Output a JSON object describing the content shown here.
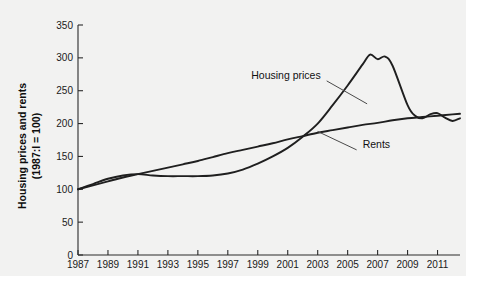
{
  "chart_data": {
    "type": "line",
    "title": "",
    "subtitle": "",
    "xlabel": "",
    "ylabel": "Housing prices and rents (1987:I = 100)",
    "ylabel_line1": "Housing prices and rents",
    "ylabel_line2": "(1987:I = 100)",
    "grid": false,
    "legend_position": "inline-annotations",
    "xlim": [
      1987,
      2012.5
    ],
    "ylim": [
      0,
      350
    ],
    "yticks": [
      0,
      50,
      100,
      150,
      200,
      250,
      300,
      350
    ],
    "ytick_labels": [
      "0",
      "50",
      "100",
      "150",
      "200",
      "250",
      "300",
      "350"
    ],
    "xticks": [
      1987,
      1989,
      1991,
      1993,
      1995,
      1997,
      1999,
      2001,
      2003,
      2005,
      2007,
      2009,
      2011
    ],
    "xtick_labels": [
      "1987",
      "1989",
      "1991",
      "1993",
      "1995",
      "1997",
      "1999",
      "2001",
      "2003",
      "2005",
      "2007",
      "2009",
      "2011"
    ],
    "series": [
      {
        "name": "Housing prices",
        "color": "#1f1f1f",
        "x": [
          1987,
          1988,
          1989,
          1990,
          1991,
          1992,
          1993,
          1994,
          1995,
          1996,
          1997,
          1998,
          1999,
          2000,
          2001,
          2002,
          2003,
          2004,
          2005,
          2006,
          2006.5,
          2007,
          2007.5,
          2008,
          2009,
          2009.5,
          2010,
          2010.5,
          2011,
          2011.5,
          2012,
          2012.5
        ],
        "values": [
          100,
          108,
          116,
          121,
          123,
          121,
          120,
          120,
          120,
          121,
          124,
          130,
          139,
          150,
          163,
          180,
          200,
          228,
          258,
          290,
          305,
          298,
          302,
          288,
          228,
          212,
          208,
          214,
          216,
          209,
          204,
          208
        ]
      },
      {
        "name": "Rents",
        "color": "#1f1f1f",
        "x": [
          1987,
          1988,
          1989,
          1990,
          1991,
          1992,
          1993,
          1994,
          1995,
          1996,
          1997,
          1998,
          1999,
          2000,
          2001,
          2002,
          2003,
          2004,
          2005,
          2006,
          2007,
          2008,
          2009,
          2010,
          2011,
          2012,
          2012.5
        ],
        "values": [
          100,
          106,
          112,
          118,
          123,
          128,
          133,
          138,
          143,
          149,
          155,
          160,
          165,
          170,
          176,
          181,
          186,
          190,
          194,
          198,
          201,
          205,
          208,
          210,
          212,
          214,
          215
        ]
      }
    ],
    "annotations": [
      {
        "label": "Housing prices",
        "x": 2003.2,
        "y": 268,
        "anchor_x": 2006.3,
        "anchor_y": 230
      },
      {
        "label": "Rents",
        "x": 2006.0,
        "y": 163,
        "anchor_x": 2003.0,
        "anchor_y": 188
      }
    ]
  }
}
